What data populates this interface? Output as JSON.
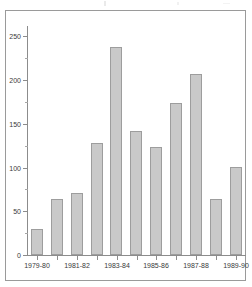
{
  "chart_data": {
    "type": "bar",
    "title": "",
    "xlabel": "",
    "ylabel": "",
    "categories": [
      "1979-80",
      "1980-81",
      "1981-82",
      "1982-83",
      "1983-84",
      "1984-85",
      "1985-86",
      "1986-87",
      "1987-88",
      "1988-89",
      "1989-90"
    ],
    "tick_labels_shown": [
      "1979-80",
      "1981-82",
      "1983-84",
      "1985-86",
      "1987-88",
      "1989-90"
    ],
    "values": [
      30,
      64,
      71,
      128,
      238,
      142,
      123,
      174,
      207,
      64,
      101
    ],
    "ylim": [
      0,
      262
    ],
    "y_ticks": [
      0,
      50,
      100,
      150,
      200,
      250
    ],
    "y_tick_labels": [
      "0",
      "50",
      "100",
      "150",
      "200",
      "250"
    ],
    "y_minor_tick_step": 25,
    "grid": false,
    "legend": null,
    "bar_color": "#c9c9c9",
    "bar_edge_color": "#9d9d9d",
    "axis_color": "#8c8c8c",
    "frame_color": "#9a9a9a",
    "text_color": "#3a3a3a"
  }
}
